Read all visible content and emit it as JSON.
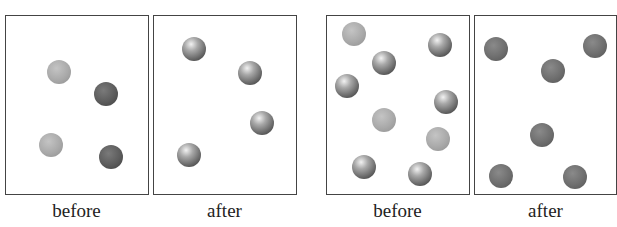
{
  "panels": [
    {
      "label": "before",
      "left": 5,
      "width": 144,
      "balls": [
        {
          "x": 53,
          "y": 56,
          "type": "light"
        },
        {
          "x": 100,
          "y": 78,
          "type": "dark"
        },
        {
          "x": 45,
          "y": 129,
          "type": "light"
        },
        {
          "x": 105,
          "y": 141,
          "type": "dark"
        }
      ]
    },
    {
      "label": "after",
      "left": 153,
      "width": 144,
      "balls": [
        {
          "x": 40,
          "y": 33,
          "type": "shiny"
        },
        {
          "x": 96,
          "y": 57,
          "type": "shiny"
        },
        {
          "x": 108,
          "y": 107,
          "type": "shiny"
        },
        {
          "x": 35,
          "y": 139,
          "type": "shiny"
        }
      ]
    },
    {
      "label": "before",
      "left": 326,
      "width": 144,
      "balls": [
        {
          "x": 27,
          "y": 18,
          "type": "light"
        },
        {
          "x": 113,
          "y": 29,
          "type": "shiny"
        },
        {
          "x": 57,
          "y": 47,
          "type": "shiny"
        },
        {
          "x": 20,
          "y": 70,
          "type": "shiny"
        },
        {
          "x": 119,
          "y": 86,
          "type": "shiny"
        },
        {
          "x": 57,
          "y": 104,
          "type": "light"
        },
        {
          "x": 111,
          "y": 123,
          "type": "light"
        },
        {
          "x": 37,
          "y": 151,
          "type": "shiny"
        },
        {
          "x": 93,
          "y": 158,
          "type": "shiny"
        }
      ]
    },
    {
      "label": "after",
      "left": 474,
      "width": 143,
      "balls": [
        {
          "x": 21,
          "y": 33,
          "type": "medium"
        },
        {
          "x": 120,
          "y": 30,
          "type": "medium"
        },
        {
          "x": 78,
          "y": 55,
          "type": "medium"
        },
        {
          "x": 67,
          "y": 119,
          "type": "medium"
        },
        {
          "x": 26,
          "y": 160,
          "type": "medium"
        },
        {
          "x": 100,
          "y": 161,
          "type": "medium"
        }
      ]
    }
  ]
}
